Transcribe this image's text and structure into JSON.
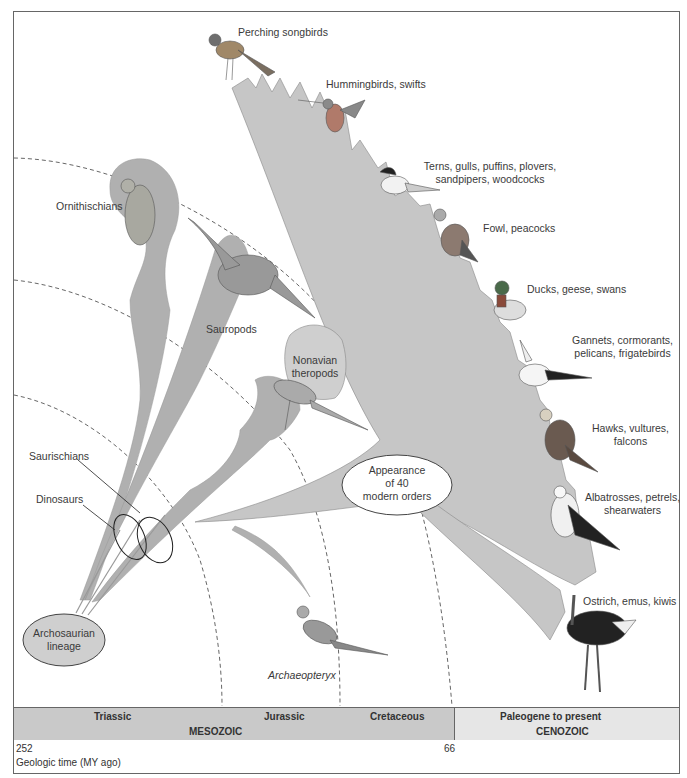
{
  "labels": {
    "perching": "Perching songbirds",
    "hummingbirds": "Hummingbirds, swifts",
    "terns_1": "Terns, gulls, puffins, plovers,",
    "terns_2": "sandpipers, woodcocks",
    "fowl": "Fowl, peacocks",
    "ducks": "Ducks, geese, swans",
    "gannets_1": "Gannets, cormorants,",
    "gannets_2": "pelicans, frigatebirds",
    "hawks_1": "Hawks, vultures,",
    "hawks_2": "falcons",
    "albatross_1": "Albatrosses, petrels,",
    "albatross_2": "shearwaters",
    "ostrich": "Ostrich, emus, kiwis",
    "ornithischians": "Ornithischians",
    "sauropods": "Sauropods",
    "nonavian_1": "Nonavian",
    "nonavian_2": "theropods",
    "saurischians": "Saurischians",
    "dinosaurs": "Dinosaurs",
    "appearance_1": "Appearance",
    "appearance_2": "of 40",
    "appearance_3": "modern orders",
    "archosaurian_1": "Archosaurian",
    "archosaurian_2": "lineage",
    "archaeopteryx": "Archaeopteryx"
  },
  "timeline": {
    "periods": [
      "Triassic",
      "Jurassic",
      "Cretaceous",
      "Paleogene to present"
    ],
    "eras": [
      "MESOZOIC",
      "CENOZOIC"
    ],
    "ticks": [
      "252",
      "66"
    ],
    "axis_label": "Geologic time (MY ago)"
  },
  "colors": {
    "branch_fill": "#b0b0b0",
    "bird_fan_fill": "#c6c6c6",
    "ellipse_fill": "#cfcfcf",
    "timebar_mesozoic": "#c9c9c9",
    "timebar_cenozoic": "#e6e6e6"
  }
}
